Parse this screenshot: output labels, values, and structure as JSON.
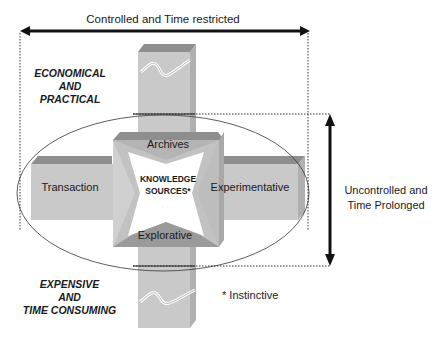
{
  "diagram": {
    "top_axis": {
      "label": "Controlled and Time restricted",
      "direction": "bidirectional-horizontal"
    },
    "right_axis": {
      "label_line1": "Uncontrolled and",
      "label_line2": "Time Prolonged",
      "direction": "bidirectional-vertical"
    },
    "top_left_label": {
      "line1": "ECONOMICAL",
      "line2": "AND",
      "line3": "PRACTICAL"
    },
    "bottom_left_label": {
      "line1": "EXPENSIVE",
      "line2": "AND",
      "line3": "TIME CONSUMING"
    },
    "center": {
      "line1": "KNOWLEDGE",
      "line2": "SOURCES*"
    },
    "arms": {
      "top": "Archives",
      "left": "Transaction",
      "right": "Experimentative",
      "bottom": "Explorative"
    },
    "footnote": "* Instinctive",
    "colors": {
      "bar_face": "#c8c8c8",
      "bar_top": "#8e8e8e",
      "bar_side": "#b4b4b4",
      "arrow": "#111111",
      "text": "#1a1a1a"
    }
  }
}
